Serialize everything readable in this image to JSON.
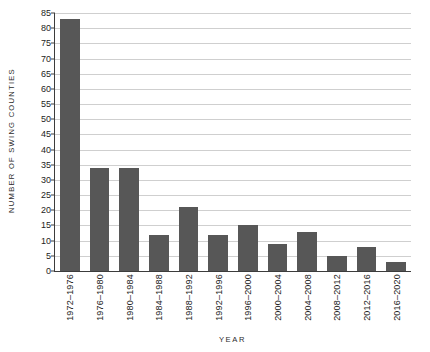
{
  "chart_data": {
    "type": "bar",
    "title": "",
    "xlabel": "YEAR",
    "ylabel": "NUMBER OF SWING COUNTIES",
    "ylim": [
      0,
      85
    ],
    "ytick_step": 5,
    "yticks": [
      0,
      5,
      10,
      15,
      20,
      25,
      30,
      35,
      40,
      45,
      50,
      55,
      60,
      65,
      70,
      75,
      80,
      85
    ],
    "grid": true,
    "legend": "none",
    "bar_color": "#575757",
    "gridline_color": "#cfcfcf",
    "axis_color": "#3c3c3c",
    "categories": [
      "1972–1976",
      "1976–1980",
      "1980–1984",
      "1984–1988",
      "1988–1992",
      "1992–1996",
      "1996–2000",
      "2000–2004",
      "2004–2008",
      "2008–2012",
      "2012–2016",
      "2016–2020"
    ],
    "values": [
      83,
      34,
      34,
      12,
      21,
      12,
      15,
      9,
      13,
      5,
      8,
      3
    ]
  }
}
